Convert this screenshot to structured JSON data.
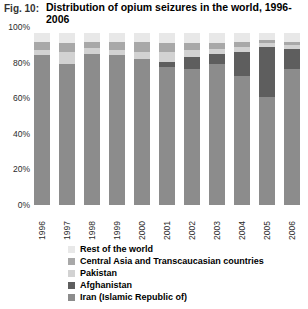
{
  "figure": {
    "label": "Fig. 10:",
    "title": "Distribution of opium seizures in the world, 1996-2006"
  },
  "chart_data": {
    "type": "bar",
    "stacked": true,
    "normalized_percent": true,
    "title": "Distribution of opium seizures in the world, 1996-2006",
    "xlabel": "",
    "ylabel": "",
    "ylim": [
      0,
      100
    ],
    "yticks": [
      0,
      20,
      40,
      60,
      80,
      100
    ],
    "ytick_labels": [
      "0%",
      "20%",
      "40%",
      "60%",
      "80%",
      "100%"
    ],
    "grid": false,
    "legend_position": "below",
    "categories": [
      "1996",
      "1997",
      "1998",
      "1999",
      "2000",
      "2001",
      "2002",
      "2003",
      "2004",
      "2005",
      "2006"
    ],
    "series": [
      {
        "name": "Iran (Islamic Republic of)",
        "color": "#8c8c8c",
        "values": [
          87,
          82,
          88,
          87,
          85,
          80,
          79,
          82,
          75,
          63,
          79
        ]
      },
      {
        "name": "Afghanistan",
        "color": "#5e5e5e",
        "values": [
          0,
          0,
          0,
          0,
          0,
          3,
          7,
          6,
          14,
          29,
          12
        ]
      },
      {
        "name": "Pakistan",
        "color": "#d2d2d2",
        "values": [
          3,
          7,
          3,
          3,
          4,
          6,
          4,
          3,
          3,
          2,
          2
        ]
      },
      {
        "name": "Central Asia and Transcaucasian countries",
        "color": "#a8a8a8",
        "values": [
          5,
          5,
          4,
          5,
          6,
          5,
          4,
          3,
          3,
          2,
          2
        ]
      },
      {
        "name": "Rest of the world",
        "color": "#e8e8e8",
        "values": [
          5,
          6,
          5,
          5,
          5,
          6,
          6,
          6,
          5,
          4,
          5
        ]
      }
    ]
  },
  "legend": {
    "items": [
      {
        "label": "Rest of the world",
        "color": "#e8e8e8"
      },
      {
        "label": "Central Asia and Transcaucasian countries",
        "color": "#a8a8a8"
      },
      {
        "label": "Pakistan",
        "color": "#d2d2d2"
      },
      {
        "label": "Afghanistan",
        "color": "#5e5e5e"
      },
      {
        "label": "Iran (Islamic Republic of)",
        "color": "#8c8c8c"
      }
    ]
  }
}
